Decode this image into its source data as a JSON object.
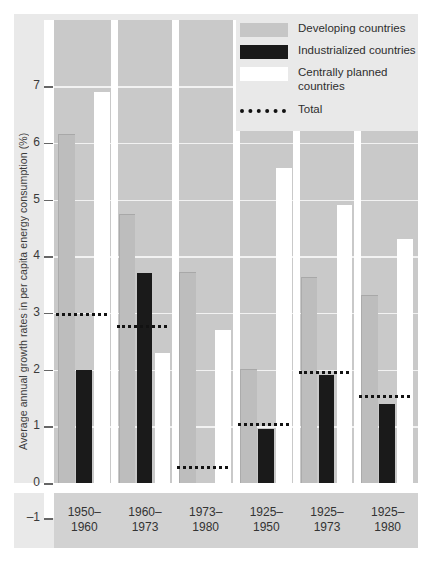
{
  "chart_data": {
    "type": "bar",
    "title": "",
    "xlabel": "",
    "ylabel": "Average annual growth rates in per capita energy consumption (%)",
    "ylim": [
      -1,
      7.4
    ],
    "yticks": [
      7,
      6,
      5,
      4,
      3,
      2,
      1,
      0,
      -1
    ],
    "grid": true,
    "legend_position": "top-right",
    "categories": [
      "1950–1960",
      "1960–1973",
      "1973–1980",
      "1925–1950",
      "1925–1973",
      "1925–1980"
    ],
    "categories_lines": [
      [
        "1950–",
        "1960"
      ],
      [
        "1960–",
        "1973"
      ],
      [
        "1973–",
        "1980"
      ],
      [
        "1925–",
        "1950"
      ],
      [
        "1925–",
        "1973"
      ],
      [
        "1925–",
        "1980"
      ]
    ],
    "series": [
      {
        "name": "Developing countries",
        "key": "dev",
        "color": "#bdbdbd",
        "values": [
          6.13,
          4.72,
          3.7,
          2.0,
          3.62,
          3.3
        ]
      },
      {
        "name": "Industrialized countries",
        "key": "ind",
        "color": "#1a1a1a",
        "values": [
          2.0,
          3.7,
          -0.45,
          0.95,
          1.9,
          1.4
        ]
      },
      {
        "name": "Centrally planned countries",
        "key": "cp",
        "color": "#ffffff",
        "values": [
          6.9,
          2.3,
          2.7,
          5.55,
          4.9,
          4.3
        ]
      }
    ],
    "total": {
      "name": "Total",
      "style": "dotted",
      "color": "#121212",
      "values": [
        3.0,
        2.78,
        0.3,
        1.05,
        1.97,
        1.55
      ]
    }
  },
  "legend": {
    "items": [
      {
        "label": "Developing countries",
        "swatch": "dev"
      },
      {
        "label": "Industrialized countries",
        "swatch": "ind"
      },
      {
        "label": "Centrally planned countries",
        "swatch": "cp"
      },
      {
        "label": "Total",
        "swatch": "total"
      }
    ]
  },
  "colors": {
    "page_background": "#ffffff",
    "panel_background": "#e9e9e9",
    "plot_background": "#c9c9c9",
    "label_band": "#d2d2d2",
    "gridline": "#f2f2f2",
    "developing": "#bdbdbd",
    "industrialized": "#1a1a1a",
    "centrally_planned": "#ffffff",
    "total_dots": "#121212",
    "text": "#333333"
  }
}
